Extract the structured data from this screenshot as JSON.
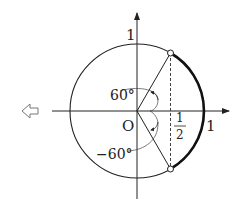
{
  "diagram": {
    "type": "unit-circle",
    "origin_label": "O",
    "x_axis_tick_label": "1",
    "y_axis_tick_label": "1",
    "angle_upper_label": "60°",
    "angle_lower_label": "−60°",
    "fraction": {
      "numerator": "1",
      "denominator": "2"
    },
    "highlighted_arc": "from −60° to 60°",
    "side_icon": "left-arrow-icon",
    "colors": {
      "stroke": "#222222",
      "highlight": "#111111",
      "dashed": "#444444"
    }
  }
}
